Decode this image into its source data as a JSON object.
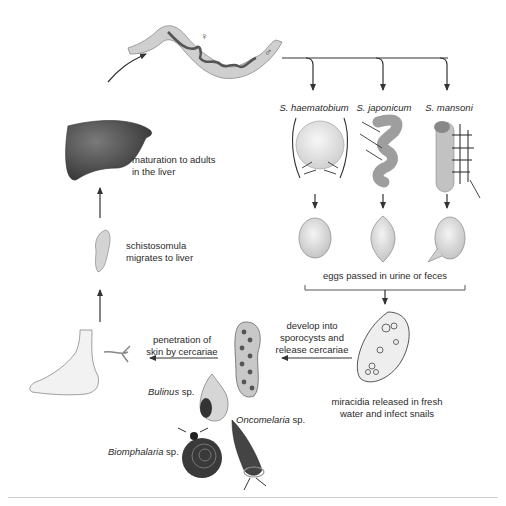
{
  "diagram": {
    "species": [
      {
        "label": "S. haematobium",
        "organ": "bladder",
        "egg_shape": "oval-terminal-spine"
      },
      {
        "label": "S. japonicum",
        "organ": "intestine",
        "egg_shape": "rounded-diamond"
      },
      {
        "label": "S. mansoni",
        "organ": "colon",
        "egg_shape": "oval-lateral-spine"
      }
    ],
    "worm_symbols": {
      "female": "♀",
      "male": "♂"
    },
    "labels": {
      "liver": "maturation to adults\nin the liver",
      "liver_line1": "maturation to adults",
      "liver_line2": "in the liver",
      "schistosomula_line1": "schistosomula",
      "schistosomula_line2": "migrates to liver",
      "eggs": "eggs passed in urine or feces",
      "miracidia_line1": "miracidia released in fresh",
      "miracidia_line2": "water and infect snails",
      "sporocysts_line1": "develop into",
      "sporocysts_line2": "sporocysts and",
      "sporocysts_line3": "release cercariae",
      "penetration_line1": "penetration of",
      "penetration_line2": "skin by cercariae"
    },
    "snails": [
      {
        "genus": "Bulinus",
        "suffix": " sp."
      },
      {
        "genus": "Oncomelaria",
        "suffix": " sp."
      },
      {
        "genus": "Biomphalaria",
        "suffix": " sp."
      }
    ],
    "colors": {
      "line": "#333333",
      "worm_fill": "#cfcfcf",
      "worm_dark": "#555555",
      "liver": "#4a4a4a",
      "organ_fill": "#bdbdbd",
      "egg_fill": "#d8d8d8",
      "rule": "#cfcfcf"
    }
  }
}
